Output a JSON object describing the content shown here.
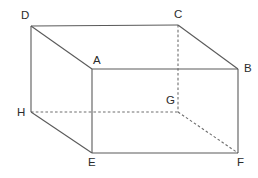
{
  "figure": {
    "background_color": "#ffffff",
    "solid_edge_color": "#5a5a5a",
    "hidden_edge_color": "#6e6e6e",
    "label_color": "#2b2b2b"
  },
  "labels": {
    "a": "A",
    "b": "B",
    "c": "C",
    "d": "D",
    "e": "E",
    "f": "F",
    "g": "G",
    "h": "H"
  },
  "chart_data": {
    "type": "diagram",
    "subtype": "3d-cuboid-oblique-projection",
    "vertices": [
      {
        "name": "D",
        "x": 31,
        "y": 26,
        "hidden": false,
        "label_dx": -10,
        "label_dy": -16
      },
      {
        "name": "C",
        "x": 178,
        "y": 25,
        "hidden": false,
        "label_dx": -4,
        "label_dy": -16
      },
      {
        "name": "A",
        "x": 92,
        "y": 69,
        "hidden": false,
        "label_dx": 1,
        "label_dy": -14
      },
      {
        "name": "B",
        "x": 238,
        "y": 69,
        "hidden": false,
        "label_dx": 6,
        "label_dy": -6
      },
      {
        "name": "H",
        "x": 31,
        "y": 112,
        "hidden": false,
        "label_dx": -14,
        "label_dy": -5
      },
      {
        "name": "G",
        "x": 178,
        "y": 112,
        "hidden": true,
        "label_dx": -12,
        "label_dy": -17
      },
      {
        "name": "E",
        "x": 92,
        "y": 153,
        "hidden": false,
        "label_dx": -4,
        "label_dy": 4
      },
      {
        "name": "F",
        "x": 238,
        "y": 153,
        "hidden": false,
        "label_dx": -1,
        "label_dy": 4
      }
    ],
    "edges": [
      {
        "from": "D",
        "to": "C",
        "style": "solid"
      },
      {
        "from": "D",
        "to": "A",
        "style": "solid"
      },
      {
        "from": "A",
        "to": "B",
        "style": "solid"
      },
      {
        "from": "C",
        "to": "B",
        "style": "solid"
      },
      {
        "from": "D",
        "to": "H",
        "style": "solid"
      },
      {
        "from": "A",
        "to": "E",
        "style": "solid"
      },
      {
        "from": "B",
        "to": "F",
        "style": "solid"
      },
      {
        "from": "H",
        "to": "E",
        "style": "solid"
      },
      {
        "from": "E",
        "to": "F",
        "style": "solid"
      },
      {
        "from": "C",
        "to": "G",
        "style": "dashed"
      },
      {
        "from": "H",
        "to": "G",
        "style": "dashed"
      },
      {
        "from": "G",
        "to": "F",
        "style": "dashed"
      }
    ]
  }
}
